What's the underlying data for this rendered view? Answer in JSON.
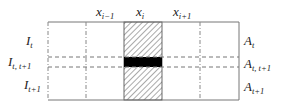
{
  "column_labels": [
    {
      "base": "x",
      "sub": "i−1"
    },
    {
      "base": "x",
      "sub": "i"
    },
    {
      "base": "x",
      "sub": "i+1"
    }
  ],
  "left_labels": [
    {
      "base": "I",
      "sub": "t"
    },
    {
      "base": "I",
      "sub": "t, t+1"
    },
    {
      "base": "I",
      "sub": "t+1"
    }
  ],
  "right_labels": [
    {
      "base": "A",
      "sub": "t"
    },
    {
      "base": "A",
      "sub": "t, t+1"
    },
    {
      "base": "A",
      "sub": "t+1"
    }
  ],
  "colors": {
    "line": "#666666",
    "hatch": "#555555",
    "band": "#000000"
  }
}
